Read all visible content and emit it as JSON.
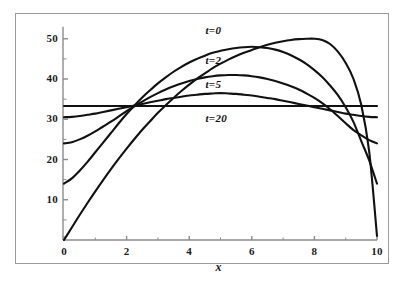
{
  "figure": {
    "background_color": "#ffffff",
    "frame_color": "#9a9a9a",
    "curve_color": "#111111",
    "axis_color": "#8c8c8c"
  },
  "chart_data": {
    "type": "line",
    "title": "",
    "subtitle": "",
    "xlabel": "x",
    "ylabel": "",
    "xlim": [
      0,
      10
    ],
    "ylim": [
      0,
      53
    ],
    "grid": false,
    "legend_position": "inline-annotations",
    "xticks": [
      0,
      2,
      4,
      6,
      8,
      10
    ],
    "xticklabels": [
      "0",
      "2",
      "4",
      "6",
      "8",
      "10"
    ],
    "yticks": [
      10,
      20,
      30,
      40,
      50
    ],
    "yticklabels": [
      "10",
      "20",
      "30",
      "40",
      "50"
    ],
    "annotations": [
      {
        "text": "t=0",
        "x": 5.0,
        "y": 52.0
      },
      {
        "text": "t=2",
        "x": 5.0,
        "y": 44.4
      },
      {
        "text": "t=5",
        "x": 5.0,
        "y": 38.6
      },
      {
        "text": "t=20",
        "x": 5.0,
        "y": 30.0
      }
    ],
    "x": [
      0,
      0.25,
      0.5,
      0.75,
      1,
      1.25,
      1.5,
      1.75,
      2,
      2.25,
      2.5,
      2.75,
      3,
      3.25,
      3.5,
      3.75,
      4,
      4.25,
      4.5,
      4.75,
      5,
      5.25,
      5.5,
      5.75,
      6,
      6.25,
      6.5,
      6.75,
      7,
      7.25,
      7.5,
      7.75,
      8,
      8.25,
      8.5,
      8.75,
      9,
      9.25,
      9.5,
      9.75,
      10
    ],
    "series": [
      {
        "name": "t=0",
        "label": "t=0",
        "values": [
          0.0,
          3.1,
          6.2,
          9.2,
          12.1,
          14.9,
          17.6,
          20.2,
          22.7,
          25.1,
          27.4,
          29.5,
          31.6,
          33.5,
          35.3,
          37.0,
          38.6,
          40.1,
          41.4,
          42.7,
          43.8,
          44.8,
          45.7,
          46.5,
          47.2,
          47.9,
          48.5,
          49.0,
          49.4,
          49.7,
          49.9,
          50.0,
          50.0,
          49.7,
          48.7,
          46.8,
          44.0,
          40.0,
          33.5,
          22.0,
          1.0
        ]
      },
      {
        "name": "t=2",
        "label": "t=2",
        "values": [
          14.0,
          15.3,
          17.2,
          19.4,
          21.8,
          24.2,
          26.6,
          29.0,
          31.3,
          33.4,
          35.4,
          37.2,
          38.9,
          40.4,
          41.8,
          43.0,
          44.1,
          45.0,
          45.8,
          46.5,
          47.0,
          47.4,
          47.7,
          47.9,
          48.0,
          47.9,
          47.7,
          47.3,
          46.7,
          45.9,
          44.9,
          43.7,
          42.2,
          40.5,
          38.4,
          36.0,
          33.0,
          29.3,
          24.5,
          19.8,
          14.0
        ]
      },
      {
        "name": "t=5",
        "label": "t=5",
        "values": [
          24.0,
          24.3,
          25.0,
          25.9,
          27.0,
          28.2,
          29.4,
          30.7,
          32.0,
          33.2,
          34.4,
          35.5,
          36.5,
          37.4,
          38.2,
          38.9,
          39.5,
          40.0,
          40.4,
          40.7,
          40.9,
          41.0,
          41.0,
          40.9,
          40.7,
          40.4,
          40.0,
          39.5,
          38.9,
          38.2,
          37.4,
          36.4,
          35.3,
          34.0,
          32.5,
          30.8,
          29.0,
          27.3,
          26.0,
          24.8,
          24.0
        ]
      },
      {
        "name": "t=20",
        "label": "t=20",
        "values": [
          30.5,
          30.6,
          30.8,
          31.1,
          31.4,
          31.8,
          32.2,
          32.6,
          33.0,
          33.4,
          33.8,
          34.2,
          34.6,
          35.0,
          35.3,
          35.6,
          35.9,
          36.1,
          36.3,
          36.4,
          36.5,
          36.4,
          36.3,
          36.1,
          35.9,
          35.6,
          35.3,
          35.0,
          34.6,
          34.2,
          33.8,
          33.4,
          33.0,
          32.6,
          32.2,
          31.8,
          31.4,
          31.1,
          30.8,
          30.6,
          30.5
        ]
      },
      {
        "name": "equilibrium",
        "label": "",
        "values": [
          33.3,
          33.3,
          33.3,
          33.3,
          33.3,
          33.3,
          33.3,
          33.3,
          33.3,
          33.3,
          33.3,
          33.3,
          33.3,
          33.3,
          33.3,
          33.3,
          33.3,
          33.3,
          33.3,
          33.3,
          33.3,
          33.3,
          33.3,
          33.3,
          33.3,
          33.3,
          33.3,
          33.3,
          33.3,
          33.3,
          33.3,
          33.3,
          33.3,
          33.3,
          33.3,
          33.3,
          33.3,
          33.3,
          33.3,
          33.3,
          33.3
        ]
      }
    ]
  }
}
